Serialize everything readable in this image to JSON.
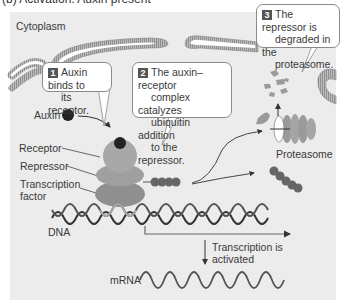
{
  "figure": {
    "title": "(b) Activation: Auxin present",
    "region_label": "Cytoplasm",
    "steps": [
      {
        "number": "1",
        "text_lines": [
          "Auxin binds to",
          "its receptor."
        ]
      },
      {
        "number": "2",
        "text_lines": [
          "The auxin–receptor",
          "complex catalyzes",
          "ubiquitin addition",
          "to the repressor."
        ]
      },
      {
        "number": "3",
        "text_lines": [
          "The repressor is",
          "degraded in the",
          "proteasome."
        ]
      }
    ],
    "labels": {
      "auxin": "Auxin",
      "receptor": "Receptor",
      "repressor": "Repressor",
      "tf_line1": "Transcription",
      "tf_line2": "factor",
      "dna": "DNA",
      "proteasome": "Proteasome",
      "transcription_line1": "Transcription is",
      "transcription_line2": "activated",
      "mrna": "mRNA"
    },
    "colors": {
      "panel_bg": "#ececec",
      "protein": "#9a9a9a",
      "auxin": "#222222",
      "ubiquitin": "#666666",
      "badge": "#555555"
    }
  }
}
